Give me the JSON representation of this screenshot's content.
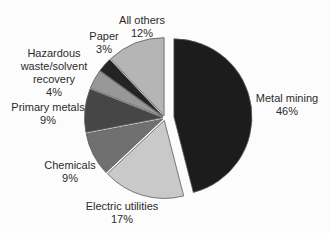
{
  "chart_data": {
    "type": "pie",
    "title": "",
    "unit": "%",
    "direction": "clockwise",
    "start_angle_deg": 0,
    "legend": "none (direct slice labels)",
    "categories": [
      "Metal mining",
      "Electric utilities",
      "Chemicals",
      "Primary metals",
      "Hazardous waste/solvent recovery",
      "Paper",
      "All others"
    ],
    "values": [
      46,
      17,
      9,
      9,
      4,
      3,
      12
    ],
    "slices": [
      {
        "label": "Metal mining",
        "value": 46,
        "color": "#1c1c1c",
        "explode": 9,
        "label_lines": [
          "Metal mining",
          "46%"
        ],
        "label_pos": {
          "x": 287,
          "y": 102
        }
      },
      {
        "label": "Electric utilities",
        "value": 17,
        "color": "#c9c9c9",
        "explode": 2.5,
        "label_lines": [
          "Electric utilities",
          "17%"
        ],
        "label_pos": {
          "x": 122,
          "y": 210
        }
      },
      {
        "label": "Chemicals",
        "value": 9,
        "color": "#707070",
        "explode": 2.5,
        "label_lines": [
          "Chemicals",
          "9%"
        ],
        "label_pos": {
          "x": 70,
          "y": 169
        }
      },
      {
        "label": "Primary metals",
        "value": 9,
        "color": "#464646",
        "explode": 2.5,
        "label_lines": [
          "Primary metals",
          "9%"
        ],
        "label_pos": {
          "x": 48,
          "y": 111
        }
      },
      {
        "label": "Hazardous waste/solvent recovery",
        "value": 4,
        "color": "#989898",
        "explode": 2.5,
        "label_lines": [
          "Hazardous",
          "waste/solvent",
          "recovery",
          "4%"
        ],
        "label_pos": {
          "x": 54,
          "y": 57
        }
      },
      {
        "label": "Paper",
        "value": 3,
        "color": "#242424",
        "explode": 2.5,
        "label_lines": [
          "Paper",
          "3%"
        ],
        "label_pos": {
          "x": 104,
          "y": 40
        }
      },
      {
        "label": "All others",
        "value": 12,
        "color": "#b5b5b5",
        "explode": 2.5,
        "label_lines": [
          "All others",
          "12%"
        ],
        "label_pos": {
          "x": 142,
          "y": 24
        }
      }
    ],
    "layout": {
      "center_x": 165,
      "center_y": 118,
      "radius": 78,
      "line_height": 13,
      "font_size": 11,
      "label_color": "#2b2b2b",
      "slice_outline": "#5a5a5a",
      "background": "#fcfcfc"
    }
  }
}
